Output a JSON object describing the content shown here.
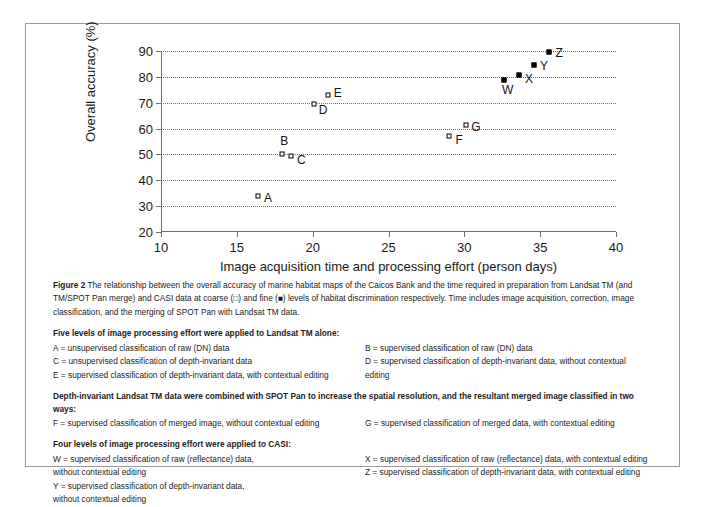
{
  "figure": {
    "label": "Figure 2",
    "caption": " The relationship between the overall accuracy of marine habitat maps of the Caicos Bank and the time required in preparation from Landsat TM (and TM/SPOT Pan merge) and CASI data at coarse (□) and fine (■) levels of habitat discrimination respectively. Time includes image acquisition, correction, image classification, and the merging of SPOT Pan with Landsat TM data."
  },
  "chart_data": {
    "type": "scatter",
    "title": "",
    "xlabel": "Image acquisition time and processing effort (person days)",
    "ylabel": "Overall accuracy (%)",
    "xlim": [
      10,
      40
    ],
    "ylim": [
      20,
      90
    ],
    "xticks": [
      10,
      15,
      20,
      25,
      30,
      35,
      40
    ],
    "yticks": [
      20,
      30,
      40,
      50,
      60,
      70,
      80,
      90
    ],
    "grid": "horizontal-dotted",
    "legend": "none",
    "series": [
      {
        "name": "Coarse level of habitat discrimination",
        "marker": "open-square",
        "points": [
          {
            "label": "A",
            "x": 16.4,
            "y": 34.0,
            "label_dx": 10,
            "label_dy": 2
          },
          {
            "label": "B",
            "x": 18.0,
            "y": 50.2,
            "label_dx": 2,
            "label_dy": -13
          },
          {
            "label": "C",
            "x": 18.6,
            "y": 49.3,
            "label_dx": 10,
            "label_dy": 4
          },
          {
            "label": "D",
            "x": 20.1,
            "y": 69.5,
            "label_dx": 9,
            "label_dy": 6
          },
          {
            "label": "E",
            "x": 21.0,
            "y": 73.0,
            "label_dx": 10,
            "label_dy": -2
          },
          {
            "label": "F",
            "x": 29.0,
            "y": 57.2,
            "label_dx": 10,
            "label_dy": 4
          },
          {
            "label": "G",
            "x": 30.1,
            "y": 61.3,
            "label_dx": 10,
            "label_dy": 2
          }
        ]
      },
      {
        "name": "Fine level of habitat discrimination",
        "marker": "filled-square",
        "points": [
          {
            "label": "W",
            "x": 32.6,
            "y": 78.6,
            "label_dx": 4,
            "label_dy": 10
          },
          {
            "label": "X",
            "x": 33.6,
            "y": 80.6,
            "label_dx": 10,
            "label_dy": 4
          },
          {
            "label": "Y",
            "x": 34.6,
            "y": 84.5,
            "label_dx": 10,
            "label_dy": 1
          },
          {
            "label": "Z",
            "x": 35.6,
            "y": 89.7,
            "label_dx": 10,
            "label_dy": 1
          }
        ]
      }
    ]
  },
  "key": {
    "sections": [
      {
        "heading": "Five levels of image processing effort were applied to Landsat TM alone:",
        "left": [
          "A = unsupervised classification of raw (DN) data",
          "C = unsupervised classification of depth-invariant data",
          "E = supervised classification of depth-invariant data, with contextual editing"
        ],
        "right": [
          "B = supervised classification of raw (DN) data",
          "D = supervised classification of depth-invariant data, without contextual editing"
        ]
      },
      {
        "heading": "Depth-invariant Landsat TM data were combined with SPOT Pan to increase the spatial resolution, and the resultant merged image classified in two ways:",
        "left": [
          "F = supervised classification of merged image, without contextual editing"
        ],
        "right": [
          "G = supervised classification of merged data, with contextual editing"
        ]
      },
      {
        "heading": "Four levels of image processing effort were applied to CASI:",
        "left": [
          "W = supervised classification of raw (reflectance) data,\nwithout contextual editing",
          "Y = supervised classification of depth-invariant data,\nwithout contextual editing"
        ],
        "right": [
          "X = supervised classification of raw (reflectance) data, with contextual editing",
          "Z = supervised classification of depth-invariant data, with contextual editing"
        ]
      }
    ]
  }
}
